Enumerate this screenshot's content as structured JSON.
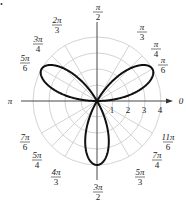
{
  "chart_data": {
    "type": "polar-line",
    "title": "",
    "equation": "r = 4 sin(3θ)",
    "series": [
      {
        "name": "rose",
        "function": "4*sin(3*theta)",
        "petals": 3,
        "max_r": 4,
        "petal_angles": [
          "π/6",
          "5π/6",
          "3π/2"
        ]
      }
    ],
    "radial_ticks": [
      1,
      2,
      3,
      4
    ],
    "radial_tick_labels": [
      "1",
      "2",
      "3",
      "4"
    ],
    "rmax": 4,
    "angle_labels": [
      {
        "angle": "0",
        "num": "0",
        "den": ""
      },
      {
        "angle": "π/6",
        "num": "π",
        "den": "6"
      },
      {
        "angle": "π/4",
        "num": "π",
        "den": "4"
      },
      {
        "angle": "π/3",
        "num": "π",
        "den": "3"
      },
      {
        "angle": "π/2",
        "num": "π",
        "den": "2"
      },
      {
        "angle": "2π/3",
        "num": "2π",
        "den": "3"
      },
      {
        "angle": "3π/4",
        "num": "3π",
        "den": "4"
      },
      {
        "angle": "5π/6",
        "num": "5π",
        "den": "6"
      },
      {
        "angle": "π",
        "num": "π",
        "den": ""
      },
      {
        "angle": "7π/6",
        "num": "7π",
        "den": "6"
      },
      {
        "angle": "5π/4",
        "num": "5π",
        "den": "4"
      },
      {
        "angle": "4π/3",
        "num": "4π",
        "den": "3"
      },
      {
        "angle": "3π/2",
        "num": "3π",
        "den": "2"
      },
      {
        "angle": "5π/3",
        "num": "5π",
        "den": "3"
      },
      {
        "angle": "7π/4",
        "num": "7π",
        "den": "4"
      },
      {
        "angle": "11π/6",
        "num": "11π",
        "den": "6"
      }
    ],
    "grid": true,
    "legend": "none"
  },
  "colors": {
    "curve": "#111111",
    "grid": "#d4d4d4",
    "axis": "#333333"
  }
}
